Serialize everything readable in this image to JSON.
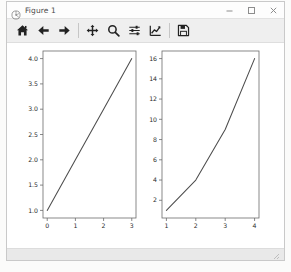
{
  "window": {
    "title": "Figure 1",
    "app_icon": "matplotlib-icon",
    "controls": {
      "minimize_label": "–",
      "maximize_label": "□",
      "close_label": "✕"
    }
  },
  "toolbar": {
    "buttons": [
      {
        "name": "home-button",
        "icon": "home-icon",
        "tooltip": "Reset original view"
      },
      {
        "name": "back-button",
        "icon": "arrow-left-icon",
        "tooltip": "Back to previous view"
      },
      {
        "name": "forward-button",
        "icon": "arrow-right-icon",
        "tooltip": "Forward to next view"
      },
      {
        "name": "pan-button",
        "icon": "move-cross-icon",
        "tooltip": "Pan axes with left mouse, zoom with right"
      },
      {
        "name": "zoom-button",
        "icon": "magnifier-icon",
        "tooltip": "Zoom to rectangle"
      },
      {
        "name": "subplots-button",
        "icon": "sliders-icon",
        "tooltip": "Configure subplots"
      },
      {
        "name": "customize-button",
        "icon": "line-chart-icon",
        "tooltip": "Edit axis, curve and image parameters"
      },
      {
        "name": "save-button",
        "icon": "floppy-disk-icon",
        "tooltip": "Save the figure"
      }
    ],
    "separator_after": [
      2,
      6
    ]
  },
  "status_bar": {
    "text": ""
  },
  "chart_data": [
    {
      "id": "left-subplot",
      "type": "line",
      "title": "",
      "xlabel": "",
      "ylabel": "",
      "x": [
        0,
        1,
        2,
        3
      ],
      "values": [
        1,
        2,
        3,
        4
      ],
      "xticks": [
        "0",
        "1",
        "2",
        "3"
      ],
      "xtick_values": [
        0,
        1,
        2,
        3
      ],
      "yticks": [
        "1.0",
        "1.5",
        "2.0",
        "2.5",
        "3.0",
        "3.5",
        "4.0"
      ],
      "ytick_values": [
        1.0,
        1.5,
        2.0,
        2.5,
        3.0,
        3.5,
        4.0
      ],
      "xlim": [
        -0.15,
        3.15
      ],
      "ylim": [
        0.85,
        4.15
      ],
      "grid": false,
      "legend": null,
      "line_color": "#4d4d4d"
    },
    {
      "id": "right-subplot",
      "type": "line",
      "title": "",
      "xlabel": "",
      "ylabel": "",
      "x": [
        1,
        2,
        3,
        4
      ],
      "values": [
        1,
        4,
        9,
        16
      ],
      "xticks": [
        "1",
        "2",
        "3",
        "4"
      ],
      "xtick_values": [
        1,
        2,
        3,
        4
      ],
      "yticks": [
        "2",
        "4",
        "6",
        "8",
        "10",
        "12",
        "14",
        "16"
      ],
      "ytick_values": [
        2,
        4,
        6,
        8,
        10,
        12,
        14,
        16
      ],
      "xlim": [
        0.85,
        4.15
      ],
      "ylim": [
        0.25,
        16.75
      ],
      "grid": false,
      "legend": null,
      "line_color": "#4d4d4d"
    }
  ],
  "colors": {
    "line": "#4d4d4d",
    "axis": "#6b6b6b",
    "toolbar_bg": "#efefef",
    "canvas_bg": "#ffffff",
    "titlebar_bg": "#fdfdfd"
  }
}
